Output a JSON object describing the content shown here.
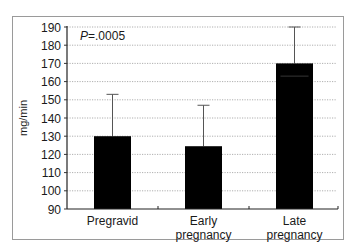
{
  "chart_data": {
    "type": "bar",
    "title": "",
    "xlabel": "",
    "ylabel": "mg/min",
    "ylim": [
      90,
      190
    ],
    "yticks": [
      90,
      100,
      110,
      120,
      130,
      140,
      150,
      160,
      170,
      180,
      190
    ],
    "grid": true,
    "legend": null,
    "categories": [
      "Pregravid",
      "Early pregnancy",
      "Late pregnancy"
    ],
    "category_lines": [
      [
        "Pregravid"
      ],
      [
        "Early",
        "pregnancy"
      ],
      [
        "Late",
        "pregnancy"
      ]
    ],
    "values": [
      130,
      124.5,
      170
    ],
    "error_upper": [
      153,
      147,
      190
    ],
    "bar_color": "#000000",
    "annotations": [
      {
        "text": "P=.0005",
        "italic_prefix": "P",
        "position": "top-left"
      }
    ]
  },
  "labels": {
    "ylabel": "mg/min",
    "annotation_italic": "P",
    "annotation_rest": "=.0005"
  }
}
